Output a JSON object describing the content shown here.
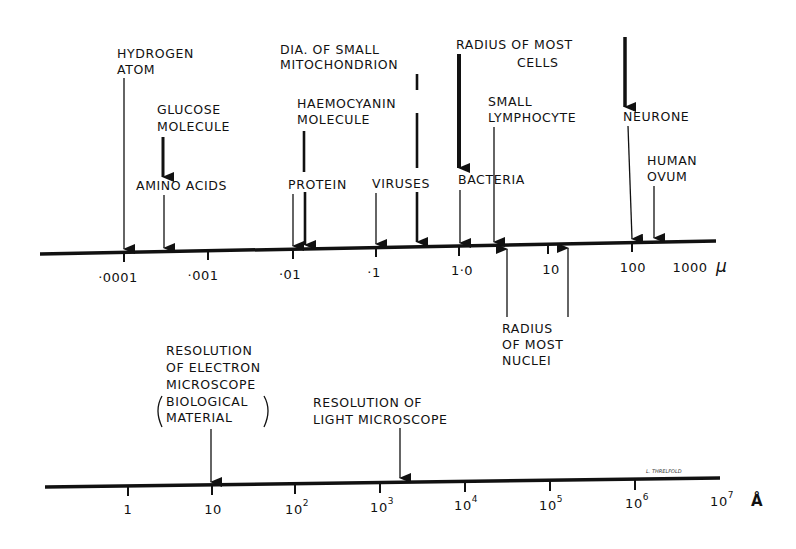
{
  "diagram": {
    "type": "size-scale",
    "upper_scale": {
      "unit": "µ",
      "ticks": [
        ".0001",
        ".001",
        ".01",
        ".1",
        "1.0",
        "10",
        "100",
        "1000"
      ],
      "annotations_above": [
        {
          "lines": [
            "HYDROGEN",
            "ATOM"
          ],
          "value_approx": "0.0001"
        },
        {
          "lines": [
            "GLUCOSE",
            "MOLECULE"
          ],
          "value_approx": "0.0003"
        },
        {
          "lines": [
            "AMINO ACIDS"
          ],
          "value_approx": "0.0003"
        },
        {
          "lines": [
            "DIA. OF SMALL",
            "MITOCHONDRION"
          ],
          "value_approx": "0.3"
        },
        {
          "lines": [
            "HAEMOCYANIN",
            "MOLECULE"
          ],
          "value_approx": "0.013"
        },
        {
          "lines": [
            "PROTEIN"
          ],
          "value_approx": "0.01"
        },
        {
          "lines": [
            "VIRUSES"
          ],
          "value_approx": "0.1"
        },
        {
          "lines": [
            "RADIUS OF MOST",
            "CELLS"
          ],
          "value_approx": "1.0 – 100"
        },
        {
          "lines": [
            "BACTERIA"
          ],
          "value_approx": "1.0"
        },
        {
          "lines": [
            "SMALL",
            "LYMPHOCYTE"
          ],
          "value_approx": "2.5"
        },
        {
          "lines": [
            "NEURONE"
          ],
          "value_approx": "100"
        },
        {
          "lines": [
            "HUMAN",
            "OVUM"
          ],
          "value_approx": "180"
        }
      ],
      "annotations_below": [
        {
          "lines": [
            "RADIUS",
            "OF MOST",
            "NUCLEI"
          ],
          "value_approx": "3 – 15"
        }
      ]
    },
    "lower_scale": {
      "unit": "Å",
      "ticks": [
        "1",
        "10",
        "10²",
        "10³",
        "10⁴",
        "10⁵",
        "10⁶",
        "10⁷"
      ],
      "tick_base": [
        "1",
        "10",
        "10",
        "10",
        "10",
        "10",
        "10",
        "10"
      ],
      "tick_exp": [
        "",
        "",
        "2",
        "3",
        "4",
        "5",
        "6",
        "7"
      ],
      "annotations_above": [
        {
          "lines": [
            "RESOLUTION",
            "OF ELECTRON",
            "MICROSCOPE",
            "(BIOLOGICAL",
            "MATERIAL)"
          ],
          "value_approx": "10"
        },
        {
          "lines": [
            "RESOLUTION OF",
            "LIGHT MICROSCOPE"
          ],
          "value_approx": "2000"
        }
      ]
    }
  },
  "labels": {
    "hydrogen": [
      "HYDROGEN",
      "ATOM"
    ],
    "glucose": [
      "GLUCOSE",
      "MOLECULE"
    ],
    "amino": "AMINO ACIDS",
    "mito": [
      "DIA. OF SMALL",
      "MITOCHONDRION"
    ],
    "haemo": [
      "HAEMOCYANIN",
      "MOLECULE"
    ],
    "protein": "PROTEIN",
    "viruses": "VIRUSES",
    "cells": [
      "RADIUS OF MOST",
      "CELLS"
    ],
    "bacteria": "BACTERIA",
    "lympho": [
      "SMALL",
      "LYMPHOCYTE"
    ],
    "neurone": "NEURONE",
    "ovum": [
      "HUMAN",
      "OVUM"
    ],
    "nuclei": [
      "RADIUS",
      "OF MOST",
      "NUCLEI"
    ],
    "em": [
      "RESOLUTION",
      "OF ELECTRON",
      "MICROSCOPE",
      "BIOLOGICAL",
      "MATERIAL"
    ],
    "lm": [
      "RESOLUTION OF",
      "LIGHT MICROSCOPE"
    ]
  },
  "upper_ticks": [
    "·0001",
    "·001",
    "·01",
    "·1",
    "1·0",
    "10",
    "100",
    "1000"
  ],
  "upper_unit": "µ",
  "lower_ticks_base": [
    "1",
    "10",
    "10",
    "10",
    "10",
    "10",
    "10",
    "10"
  ],
  "lower_ticks_exp": [
    "",
    "",
    "2",
    "3",
    "4",
    "5",
    "6",
    "7"
  ],
  "lower_unit": "Å",
  "signature": "L. THRELFOLD"
}
